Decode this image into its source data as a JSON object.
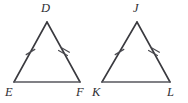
{
  "figure": {
    "kind": "geometry-diagram",
    "background_color": "#ffffff",
    "stroke_color": "#3a3a3f",
    "base_stroke_color": "#57575d",
    "tick_color": "#4a4a50",
    "label_color": "#2e2e33",
    "width": 188,
    "height": 103
  },
  "triangles": [
    {
      "name": "triangle-def",
      "vertices": [
        {
          "label": "D",
          "role": "apex",
          "x": 47,
          "y": 22,
          "label_x": 41,
          "label_y": 2
        },
        {
          "label": "E",
          "role": "bottom-left",
          "x": 14,
          "y": 82,
          "label_x": 5,
          "label_y": 86
        },
        {
          "label": "F",
          "role": "bottom-right",
          "x": 80,
          "y": 82,
          "label_x": 76,
          "label_y": 86
        }
      ],
      "marks": [
        {
          "side": "DE",
          "ticks": 1
        },
        {
          "side": "DF",
          "ticks": 2
        },
        {
          "side": "EF",
          "ticks": 0
        }
      ]
    },
    {
      "name": "triangle-jkl",
      "vertices": [
        {
          "label": "J",
          "role": "apex",
          "x": 137,
          "y": 22,
          "label_x": 133,
          "label_y": 2
        },
        {
          "label": "K",
          "role": "bottom-left",
          "x": 102,
          "y": 82,
          "label_x": 92,
          "label_y": 86
        },
        {
          "label": "L",
          "role": "bottom-right",
          "x": 170,
          "y": 82,
          "label_x": 167,
          "label_y": 86
        }
      ],
      "marks": [
        {
          "side": "JK",
          "ticks": 1
        },
        {
          "side": "JL",
          "ticks": 2
        },
        {
          "side": "KL",
          "ticks": 0
        }
      ]
    }
  ],
  "labels": {
    "d": "D",
    "e": "E",
    "f": "F",
    "j": "J",
    "k": "K",
    "l": "L"
  }
}
